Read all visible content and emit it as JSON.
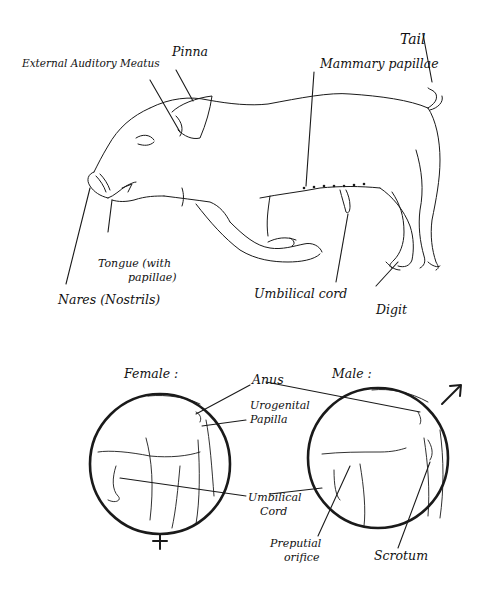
{
  "figure": {
    "whole_body": {
      "labels": {
        "external_auditory_meatus": "External Auditory Meatus",
        "pinna": "Pinna",
        "tail": "Tail",
        "mammary_papillae": "Mammary papillae",
        "tongue_line1": "Tongue (with",
        "tongue_line2": "papillae)",
        "nares": "Nares (Nostrils)",
        "umbilical_cord": "Umbilical cord",
        "digit": "Digit"
      }
    },
    "female_inset": {
      "title": "Female :",
      "symbol": "♀",
      "labels": {
        "anus": "Anus",
        "urogenital_line1": "Urogenital",
        "urogenital_line2": "Papilla",
        "umbilical_line1": "Umbilical",
        "umbilical_line2": "Cord"
      }
    },
    "male_inset": {
      "title": "Male :",
      "symbol": "♂",
      "labels": {
        "preputial_line1": "Preputial",
        "preputial_line2": "orifice",
        "scrotum": "Scrotum"
      }
    }
  }
}
